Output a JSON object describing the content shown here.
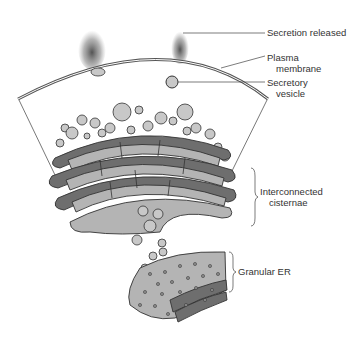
{
  "diagram": {
    "labels": {
      "secretion_released": "Secretion released",
      "plasma_membrane_1": "Plasma",
      "plasma_membrane_2": "membrane",
      "secretory_vesicle_1": "Secretory",
      "secretory_vesicle_2": "vesicle",
      "interconnected_cisternae_1": "Interconnected",
      "interconnected_cisternae_2": "cisternae",
      "granular_er": "Granular ER"
    },
    "colors": {
      "cisterna_dark": "#6e6e6e",
      "cisterna_light": "#b4b4b4",
      "outline": "#333333",
      "vesicle": "#c8c8c8",
      "secretion": "#5a5a5a"
    }
  }
}
